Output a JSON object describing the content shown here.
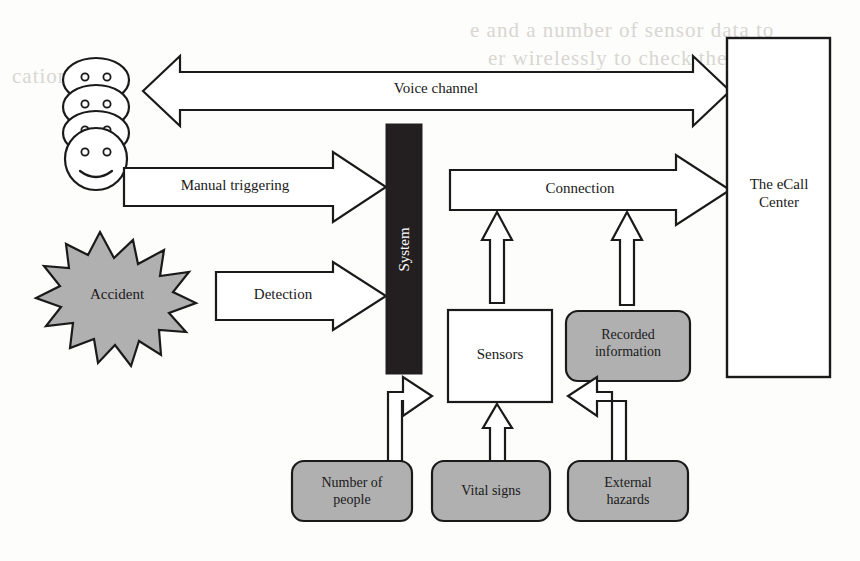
{
  "figure": {
    "background_color": "#fdfdfc",
    "line_color": "#1a1a1a",
    "fill_gray": "#b0b0b0",
    "fill_white": "#ffffff",
    "fill_black": "#231f20"
  },
  "nodes": {
    "occupants": {
      "label": "",
      "icon": "smiley-faces-stack",
      "count": 4
    },
    "accident": {
      "label": "Accident",
      "shape": "explosion-star",
      "fill": "#b0b0b0"
    },
    "system": {
      "label": "System",
      "shape": "vertical-bar",
      "fill": "#231f20",
      "text_color": "#ffffff",
      "orientation": "vertical"
    },
    "ecall_center": {
      "label": "The eCall\nCenter",
      "shape": "rectangle",
      "fill": "#ffffff"
    },
    "sensors": {
      "label": "Sensors",
      "shape": "rectangle",
      "fill": "#ffffff"
    },
    "recorded_information": {
      "label": "Recorded\ninformation",
      "shape": "rounded-rectangle",
      "fill": "#b0b0b0"
    },
    "number_of_people": {
      "label": "Number of\npeople",
      "shape": "rounded-rectangle",
      "fill": "#b0b0b0"
    },
    "vital_signs": {
      "label": "Vital signs",
      "shape": "rounded-rectangle",
      "fill": "#b0b0b0"
    },
    "external_hazards": {
      "label": "External\nhazards",
      "shape": "rounded-rectangle",
      "fill": "#b0b0b0"
    }
  },
  "arrows": {
    "voice_channel": {
      "label": "Voice channel",
      "from": "occupants",
      "to": "ecall_center",
      "style": "double-headed-block-arrow"
    },
    "manual_triggering": {
      "label": "Manual triggering",
      "from": "occupants",
      "to": "system",
      "style": "block-arrow-right"
    },
    "detection": {
      "label": "Detection",
      "from": "accident",
      "to": "system",
      "style": "block-arrow-right"
    },
    "connection": {
      "label": "Connection",
      "from": "system",
      "to": "ecall_center",
      "style": "block-arrow-right"
    },
    "sensors_to_connection": {
      "label": "",
      "from": "sensors",
      "to": "connection",
      "style": "block-arrow-up"
    },
    "recorded_to_connection": {
      "label": "",
      "from": "recorded_information",
      "to": "connection",
      "style": "block-arrow-up"
    },
    "people_to_sensors": {
      "label": "",
      "from": "number_of_people",
      "to": "sensors",
      "style": "bent-block-arrow-up-right"
    },
    "vital_to_sensors": {
      "label": "",
      "from": "vital_signs",
      "to": "sensors",
      "style": "block-arrow-up"
    },
    "hazards_to_sensors": {
      "label": "",
      "from": "external_hazards",
      "to": "sensors",
      "style": "bent-block-arrow-up-left"
    }
  },
  "background_bleed": {
    "line1": "e and a number of sensor data to",
    "line2": "er wirelessly to check the",
    "line3": "cation"
  }
}
